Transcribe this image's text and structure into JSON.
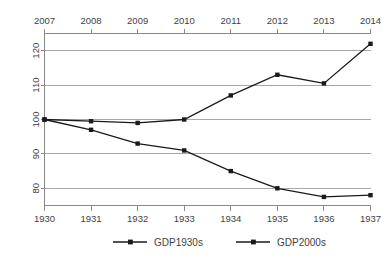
{
  "chart_data": {
    "type": "line",
    "title": "",
    "xlabel": "",
    "ylabel": "",
    "ylim": [
      75,
      125
    ],
    "grid": true,
    "legend_position": "bottom",
    "top_axis_label": "Year (2000s)",
    "bottom_axis_label": "Year (1930s)",
    "x_top_categories": [
      "2007",
      "2008",
      "2009",
      "2010",
      "2011",
      "2012",
      "2013",
      "2014"
    ],
    "x_bottom_categories": [
      "1930",
      "1931",
      "1932",
      "1933",
      "1934",
      "1935",
      "1936",
      "1937"
    ],
    "y_ticks": [
      "120",
      "110",
      "100",
      "90",
      "80"
    ],
    "y_tick_values": [
      120,
      110,
      100,
      90,
      80
    ],
    "series": [
      {
        "name": "GDP1930s",
        "axis": "bottom",
        "values": [
          100,
          97,
          93,
          91,
          85,
          80,
          77.5,
          78
        ]
      },
      {
        "name": "GDP2000s",
        "axis": "top",
        "values": [
          100,
          99.5,
          99,
          100,
          107,
          113,
          110.5,
          122
        ]
      }
    ],
    "legend": [
      {
        "label": "GDP1930s"
      },
      {
        "label": "GDP2000s"
      }
    ],
    "colors": {
      "series_line": "#1a1a1a",
      "gridline": "#a8a8a8",
      "axis": "#8a8a8a",
      "text": "#3f3f3f",
      "background": "#ffffff"
    }
  }
}
